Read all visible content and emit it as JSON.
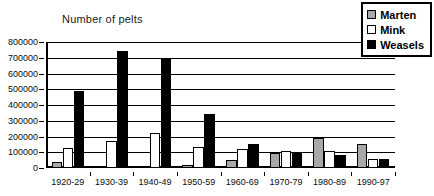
{
  "chart_data": {
    "type": "bar",
    "title": "Number of pelts",
    "xlabel": "",
    "ylabel": "Number of pelts",
    "ylim": [
      0,
      800000
    ],
    "ytick_step": 100000,
    "grid": true,
    "legend_position": "top-right",
    "categories": [
      "1920-29",
      "1930-39",
      "1940-49",
      "1950-59",
      "1960-69",
      "1970-79",
      "1980-89",
      "1990-97"
    ],
    "ytick_labels": [
      "0",
      "100000",
      "200000",
      "300000",
      "400000",
      "500000",
      "600000",
      "700000",
      "800000"
    ],
    "series": [
      {
        "name": "Marten",
        "color": "#a8a8a8",
        "values": [
          38000,
          12000,
          14000,
          18000,
          50000,
          95000,
          190000,
          155000
        ]
      },
      {
        "name": "Mink",
        "color": "#ffffff",
        "values": [
          130000,
          170000,
          225000,
          135000,
          120000,
          105000,
          110000,
          55000
        ]
      },
      {
        "name": "Weasels",
        "color": "#000000",
        "values": [
          490000,
          745000,
          695000,
          345000,
          155000,
          95000,
          85000,
          60000
        ]
      }
    ]
  },
  "legend": {
    "items": [
      {
        "label": "Marten"
      },
      {
        "label": "Mink"
      },
      {
        "label": "Weasels"
      }
    ]
  }
}
